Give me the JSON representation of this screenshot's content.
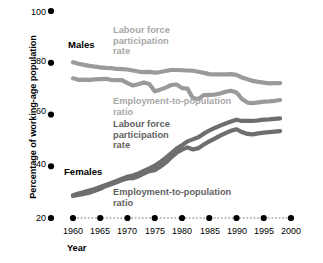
{
  "chart_data": {
    "type": "line",
    "title": "",
    "xlabel": "Year",
    "ylabel": "Percentage of working-age population",
    "xlim": [
      1960,
      2000
    ],
    "ylim": [
      20,
      100
    ],
    "grid": false,
    "legend_position": "inline-annotations",
    "y_ticks": [
      100,
      80,
      60,
      40,
      20
    ],
    "x_ticks": [
      1960,
      1965,
      1970,
      1975,
      1980,
      1985,
      1990,
      1995,
      2000
    ],
    "group_labels": [
      "Males",
      "Females"
    ],
    "annotations": [
      {
        "name": "males-lfp",
        "text": "Labour force\nparticipation\nrate",
        "color": "#a8a8a8"
      },
      {
        "name": "males-epr",
        "text": "Employment-to-population\nratio",
        "color": "#a8a8a8"
      },
      {
        "name": "females-lfp",
        "text": "Labour force\nparticipation\nrate",
        "color": "#5f5f5f"
      },
      {
        "name": "females-epr",
        "text": "Employment-to-population\nratio",
        "color": "#5f5f5f"
      }
    ],
    "x": [
      1960,
      1961,
      1962,
      1963,
      1964,
      1965,
      1966,
      1967,
      1968,
      1969,
      1970,
      1971,
      1972,
      1973,
      1974,
      1975,
      1976,
      1977,
      1978,
      1979,
      1980,
      1981,
      1982,
      1983,
      1984,
      1985,
      1986,
      1987,
      1988,
      1989,
      1990,
      1991,
      1992,
      1993,
      1994,
      1995,
      1996,
      1997,
      1998
    ],
    "series": [
      {
        "name": "Males labour force participation rate",
        "group": "Males",
        "color": "#9a9a9a",
        "values": [
          80.2,
          79.6,
          79.2,
          78.8,
          78.5,
          78.2,
          78.0,
          77.9,
          77.6,
          77.5,
          77.4,
          77.0,
          76.6,
          76.4,
          76.5,
          76.2,
          76.4,
          76.8,
          77.2,
          77.2,
          77.1,
          77.0,
          76.9,
          76.5,
          76.1,
          75.6,
          75.5,
          75.5,
          75.5,
          75.6,
          75.3,
          74.3,
          73.6,
          73.0,
          72.6,
          72.3,
          72.0,
          72.1,
          72.1
        ]
      },
      {
        "name": "Males employment-to-population ratio",
        "group": "Males",
        "color": "#9a9a9a",
        "values": [
          74.0,
          73.4,
          73.5,
          73.4,
          73.6,
          73.7,
          73.8,
          73.4,
          73.3,
          73.3,
          72.1,
          71.2,
          71.7,
          72.4,
          71.8,
          69.0,
          69.6,
          70.4,
          71.4,
          71.6,
          70.2,
          70.0,
          66.3,
          66.0,
          67.5,
          67.6,
          67.7,
          68.1,
          68.8,
          69.2,
          68.5,
          66.0,
          64.6,
          64.4,
          64.7,
          65.0,
          65.1,
          65.3,
          65.6
        ]
      },
      {
        "name": "Females labour force participation rate",
        "group": "Females",
        "color": "#6e6e6e",
        "values": [
          28.8,
          29.5,
          30.0,
          30.6,
          31.2,
          32.0,
          32.8,
          33.5,
          34.3,
          35.2,
          36.0,
          36.4,
          37.2,
          38.2,
          39.2,
          40.2,
          41.6,
          43.2,
          45.0,
          46.8,
          48.1,
          49.6,
          50.4,
          51.2,
          52.6,
          53.8,
          54.8,
          55.7,
          56.5,
          57.3,
          58.0,
          57.5,
          57.5,
          57.5,
          57.7,
          58.0,
          58.1,
          58.3,
          58.5
        ]
      },
      {
        "name": "Females employment-to-population ratio",
        "group": "Females",
        "color": "#6e6e6e",
        "values": [
          28.5,
          28.9,
          29.3,
          29.8,
          30.5,
          31.3,
          32.3,
          33.0,
          33.8,
          34.7,
          35.3,
          35.4,
          36.1,
          37.2,
          38.1,
          38.5,
          39.8,
          41.4,
          43.4,
          45.2,
          46.4,
          47.3,
          46.5,
          47.0,
          48.4,
          49.6,
          50.7,
          51.8,
          52.8,
          53.7,
          54.3,
          53.2,
          52.5,
          52.3,
          52.7,
          53.0,
          53.2,
          53.4,
          53.6
        ]
      }
    ]
  },
  "axis": {
    "y_tick_labels": [
      "100",
      "80",
      "60",
      "40",
      "20"
    ],
    "x_tick_labels": [
      "1960",
      "1965",
      "1970",
      "1975",
      "1980",
      "1985",
      "1990",
      "1995",
      "2000"
    ],
    "y_title": "Percentage of working-age population",
    "x_title": "Year"
  },
  "labels": {
    "males": "Males",
    "females": "Females",
    "males_lfp": "Labour force\nparticipation\nrate",
    "males_epr": "Employment-to-population\nratio",
    "females_lfp": "Labour force\nparticipation\nrate",
    "females_epr": "Employment-to-population\nratio"
  },
  "colors": {
    "male_line": "#9a9a9a",
    "female_line": "#6e6e6e",
    "male_label": "#a8a8a8",
    "female_label": "#5f5f5f",
    "axis_dot": "#000000",
    "baseline_dots": "#b5b5b5"
  }
}
